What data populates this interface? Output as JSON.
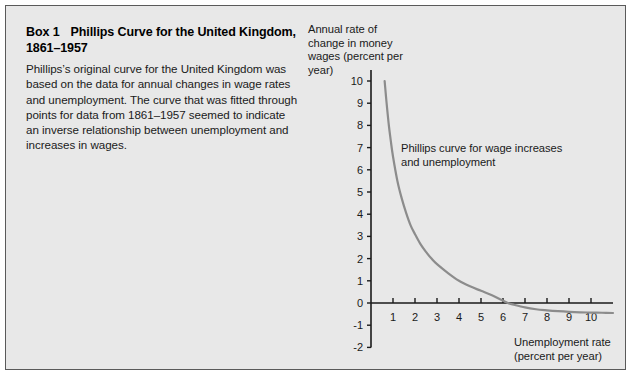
{
  "figure": {
    "background_color": "#e8e8e8",
    "border_color": "#5a5a5a"
  },
  "box": {
    "number_label": "Box 1",
    "title": "Phillips Curve for the United Kingdom, 1861–1957",
    "body": "Phillips’s original curve for the United Kingdom was based on the data for annual changes in wage rates and unemployment. The curve that was fitted through points for data from 1861–1957 seemed to indicate an inverse relationship between unemployment and increases in wages."
  },
  "chart_data": {
    "type": "line",
    "title": "",
    "xlabel": "Unemployment rate (percent per year)",
    "ylabel": "Annual rate of change in money wages (percent per year)",
    "xlim": [
      0,
      11
    ],
    "ylim": [
      -2,
      10
    ],
    "xticks": [
      1,
      2,
      3,
      4,
      5,
      6,
      7,
      8,
      9,
      10
    ],
    "yticks": [
      -2,
      -1,
      0,
      1,
      2,
      3,
      4,
      5,
      6,
      7,
      8,
      9,
      10
    ],
    "xtick_labels": [
      "1",
      "2",
      "3",
      "4",
      "5",
      "6",
      "7",
      "8",
      "9",
      "10"
    ],
    "ytick_labels": [
      "-2",
      "-1",
      "0",
      "1",
      "2",
      "3",
      "4",
      "5",
      "6",
      "7",
      "8",
      "9",
      "10"
    ],
    "grid": false,
    "legend": "none",
    "curve_color": "#8c8c8c",
    "axis_color": "#1a1a1a",
    "annotations": [
      {
        "text": "Phillips curve for wage increases and unemployment",
        "x": 2.0,
        "y": 6.6
      }
    ],
    "series": [
      {
        "name": "Phillips curve for wage increases and unemployment",
        "x": [
          0.62,
          0.7,
          0.8,
          0.9,
          1.0,
          1.2,
          1.4,
          1.6,
          1.8,
          2.0,
          2.25,
          2.5,
          2.75,
          3.0,
          3.5,
          4.0,
          4.5,
          5.0,
          5.5,
          6.0,
          6.22,
          6.5,
          7.0,
          7.5,
          8.0,
          8.5,
          9.0,
          9.5,
          10.0,
          10.5,
          11.0
        ],
        "y": [
          10.0,
          9.1,
          8.1,
          7.3,
          6.6,
          5.5,
          4.7,
          4.05,
          3.5,
          3.1,
          2.65,
          2.3,
          2.0,
          1.75,
          1.35,
          1.0,
          0.75,
          0.55,
          0.35,
          0.1,
          0.0,
          -0.08,
          -0.2,
          -0.28,
          -0.33,
          -0.37,
          -0.4,
          -0.42,
          -0.43,
          -0.44,
          -0.45
        ]
      }
    ]
  }
}
